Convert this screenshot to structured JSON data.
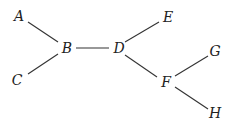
{
  "diagram": {
    "type": "tree",
    "nodes": [
      {
        "id": "A",
        "label": "A",
        "x": 19,
        "y": 21
      },
      {
        "id": "B",
        "label": "B",
        "x": 67,
        "y": 53
      },
      {
        "id": "C",
        "label": "C",
        "x": 17,
        "y": 85
      },
      {
        "id": "D",
        "label": "D",
        "x": 119,
        "y": 53
      },
      {
        "id": "E",
        "label": "E",
        "x": 168,
        "y": 22
      },
      {
        "id": "F",
        "label": "F",
        "x": 166,
        "y": 87
      },
      {
        "id": "G",
        "label": "G",
        "x": 215,
        "y": 56
      },
      {
        "id": "H",
        "label": "H",
        "x": 215,
        "y": 118
      }
    ],
    "edges": [
      {
        "from": "A",
        "to": "B",
        "x1": 28,
        "y1": 22,
        "x2": 58,
        "y2": 42
      },
      {
        "from": "C",
        "to": "B",
        "x1": 28,
        "y1": 74,
        "x2": 58,
        "y2": 54
      },
      {
        "from": "B",
        "to": "D",
        "x1": 76,
        "y1": 48,
        "x2": 109,
        "y2": 48
      },
      {
        "from": "D",
        "to": "E",
        "x1": 125,
        "y1": 42,
        "x2": 159,
        "y2": 22
      },
      {
        "from": "D",
        "to": "F",
        "x1": 125,
        "y1": 55,
        "x2": 157,
        "y2": 77
      },
      {
        "from": "F",
        "to": "G",
        "x1": 175,
        "y1": 76,
        "x2": 208,
        "y2": 56
      },
      {
        "from": "F",
        "to": "H",
        "x1": 175,
        "y1": 87,
        "x2": 208,
        "y2": 109
      }
    ]
  }
}
